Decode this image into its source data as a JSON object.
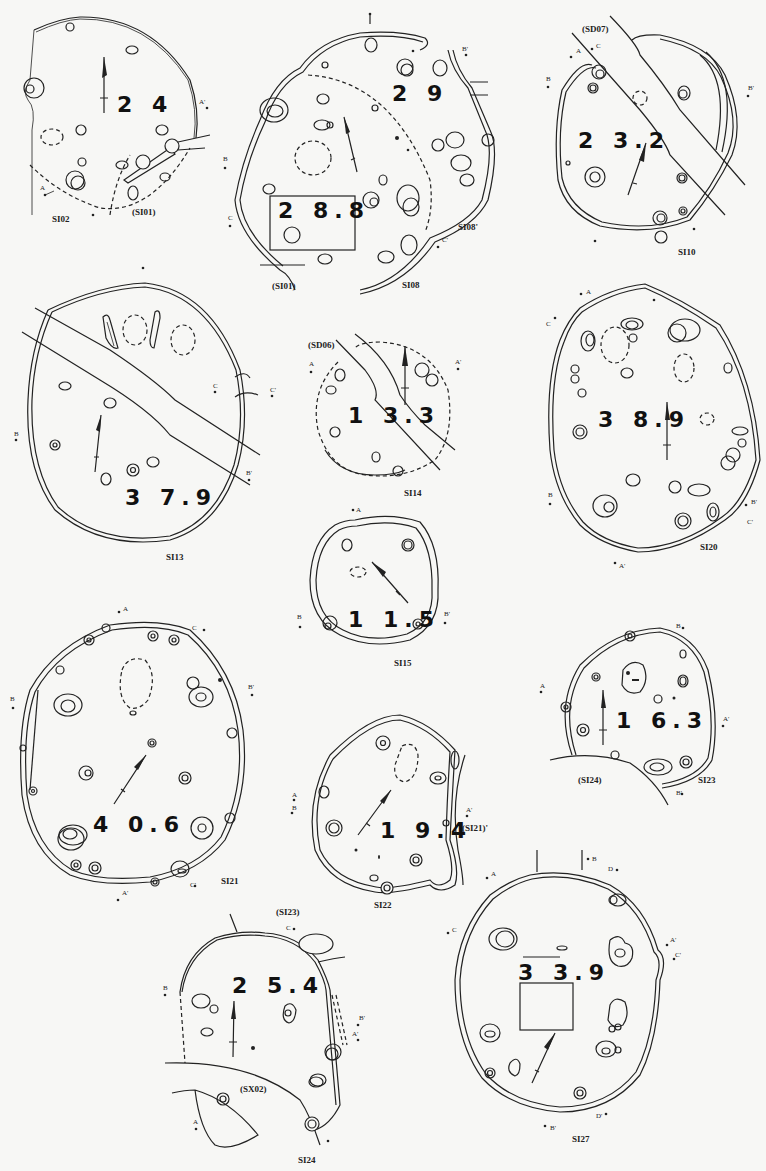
{
  "sheet": {
    "type": "archaeological pit-dwelling plans",
    "plans": [
      {
        "id": "SI02",
        "label": "SI02",
        "area": "2 4",
        "related": [
          "(SI01)"
        ],
        "sections": [
          "A",
          "A'"
        ]
      },
      {
        "id": "SI08",
        "label": "SI08",
        "label_alt": "SI08'",
        "area": "2 9",
        "area_inner": "2 8.8",
        "related": [
          "(SI01)"
        ],
        "sections": [
          "B",
          "B'",
          "C",
          "C'",
          "A"
        ]
      },
      {
        "id": "SI10",
        "label": "SI10",
        "area": "2 3.2",
        "related": [
          "(SD07)"
        ],
        "sections": [
          "A",
          "A'",
          "B",
          "B'",
          "C",
          "C'"
        ]
      },
      {
        "id": "SI13",
        "label": "SI13",
        "area": "3 7.9",
        "related": [],
        "sections": [
          "A",
          "B",
          "B'",
          "C",
          "C'"
        ]
      },
      {
        "id": "SI14",
        "label": "SI14",
        "area": "1 3.3",
        "related": [
          "(SD06)"
        ],
        "sections": [
          "A",
          "A'"
        ]
      },
      {
        "id": "SI20",
        "label": "SI20",
        "area": "3 8.9",
        "related": [],
        "sections": [
          "A",
          "A'",
          "B",
          "B'",
          "C",
          "C'"
        ]
      },
      {
        "id": "SI15",
        "label": "SI15",
        "area": "1 1.5",
        "related": [],
        "sections": [
          "A",
          "A'",
          "B",
          "B'"
        ]
      },
      {
        "id": "SI21",
        "label": "SI21",
        "area": "4 0.6",
        "related": [],
        "sections": [
          "A",
          "A'",
          "B",
          "B'",
          "C",
          "C'"
        ]
      },
      {
        "id": "SI23",
        "label": "SI23",
        "area": "1 6.3",
        "related": [
          "(SI24)"
        ],
        "sections": [
          "A",
          "A'",
          "B",
          "B'"
        ]
      },
      {
        "id": "SI22",
        "label": "SI22",
        "area": "1 9.4",
        "related": [
          "(SI21)'"
        ],
        "sections": [
          "A",
          "A'",
          "B"
        ]
      },
      {
        "id": "SI24",
        "label": "SI24",
        "area": "2 5.4",
        "related": [
          "(SI23)",
          "(SX02)"
        ],
        "sections": [
          "A",
          "A'",
          "B",
          "B'",
          "C"
        ]
      },
      {
        "id": "SI27",
        "label": "SI27",
        "area": "3 3.9",
        "related": [],
        "sections": [
          "A",
          "A'",
          "B",
          "B'",
          "C",
          "C'",
          "D",
          "D'"
        ]
      }
    ]
  },
  "labels": {
    "si02": "SI02",
    "si01_in_si02": "(SI01)",
    "si02_area": "2 4",
    "si08": "SI08",
    "si08p": "SI08'",
    "si01_in_si08": "(SI01)",
    "si08_area": "2 9",
    "si08_inner": "2 8.8",
    "sd07": "(SD07)",
    "si10": "SI10",
    "si10_area": "2 3.2",
    "si13": "SI13",
    "si13_area": "3 7.9",
    "sd06": "(SD06)",
    "si14": "SI14",
    "si14_area": "1 3.3",
    "si20": "SI20",
    "si20_area": "3 8.9",
    "si15": "SI15",
    "si15_area": "1 1.5",
    "si21": "SI21",
    "si21_area": "4 0.6",
    "si23": "SI23",
    "si24_in_si23": "(SI24)",
    "si23_area": "1 6.3",
    "si22": "SI22",
    "si21_in_si22": "(SI21)'",
    "si22_area": "1 9.4",
    "si23_in_si24": "(SI23)",
    "sx02": "(SX02)",
    "si24": "SI24",
    "si24_area": "2 5.4",
    "si27": "SI27",
    "si27_area": "3 3.9"
  },
  "section_marks": {
    "A": "A",
    "Ap": "A'",
    "B": "B",
    "Bp": "B'",
    "C": "C",
    "Cp": "C'",
    "D": "D",
    "Dp": "D'"
  },
  "colors": {
    "paper": "#f7f7f5",
    "ink": "#222222"
  }
}
